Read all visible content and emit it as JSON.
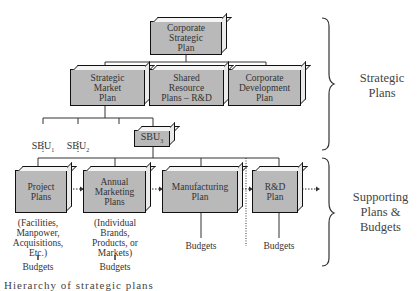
{
  "diagram": {
    "top": {
      "label": "Corporate\nStrategic\nPlan"
    },
    "level2": [
      {
        "label": "Strategic\nMarket\nPlan"
      },
      {
        "label": "Shared\nResource\nPlans – R&D"
      },
      {
        "label": "Corporate\nDevelopment\nPlan"
      }
    ],
    "sbus": [
      {
        "label": "SBU",
        "sub": "1"
      },
      {
        "label": "SBU",
        "sub": "2"
      },
      {
        "label": "SBU",
        "sub": "3"
      }
    ],
    "level4": [
      {
        "label": "Project\nPlans",
        "note": "(Facilities,\nManpower,\nAcquisitions,\nEtc.)",
        "budget": "Budgets"
      },
      {
        "label": "Annual\nMarketing\nPlans",
        "note": "(Individual\nBrands,\nProducts, or\nMarkets)",
        "budget": "Budgets"
      },
      {
        "label": "Manufacturing\nPlan",
        "budget": "Budgets"
      },
      {
        "label": "R&D\nPlan",
        "budget": "Budgets"
      }
    ],
    "braces": [
      {
        "label": "Strategic\nPlans"
      },
      {
        "label": "Supporting\nPlans &\nBudgets"
      }
    ],
    "caption": "Hierarchy of strategic plans"
  },
  "colors": {
    "box_fill": "#b9b9b9",
    "box_border": "#111111",
    "line": "#333333"
  }
}
